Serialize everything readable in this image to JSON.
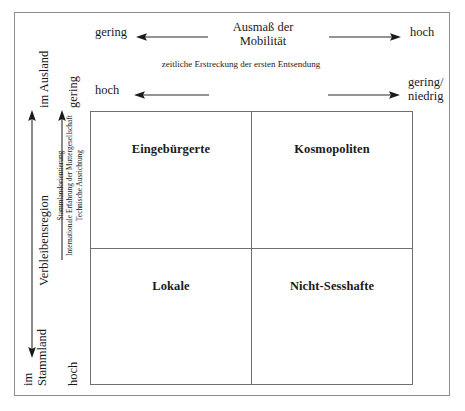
{
  "diagram": {
    "top_axis": {
      "title_line1": "Ausmaß der",
      "title_line2": "Mobilität",
      "left_label": "gering",
      "right_label": "hoch"
    },
    "second_axis": {
      "title": "zeitliche Erstreckung der ersten Entsendung",
      "left_label": "hoch",
      "right_label_line1": "gering/",
      "right_label_line2": "niedrig"
    },
    "left_axis_outer": {
      "title": "Verbleibensregion",
      "top_label": "im Ausland",
      "bottom_label_line1": "im",
      "bottom_label_line2": "Stammland"
    },
    "left_axis_inner": {
      "title_line1": "Stammlandorientierung",
      "title_line2": "Internationale Erfahrung der Muttergesellschaft",
      "title_line3": "Technische Ausrichtung",
      "top_label": "gering",
      "bottom_label": "hoch"
    },
    "quadrants": {
      "top_left": "Eingebürgerte",
      "top_right": "Kosmopoliten",
      "bottom_left": "Lokale",
      "bottom_right": "Nicht-Sesshafte"
    },
    "colors": {
      "frame": "#8b8b8b",
      "matrix_line": "#6f6f6f",
      "text": "#1a1a1a"
    }
  }
}
